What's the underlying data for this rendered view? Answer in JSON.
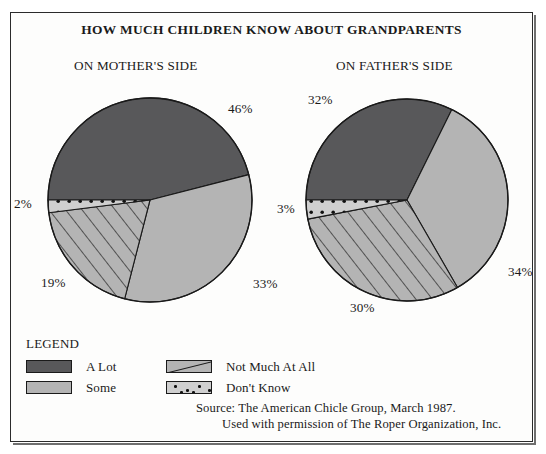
{
  "figure": {
    "title": "HOW MUCH CHILDREN KNOW ABOUT GRANDPARENTS",
    "subtitle_left": "ON MOTHER'S SIDE",
    "subtitle_right": "ON FATHER'S SIDE"
  },
  "legend": {
    "heading": "LEGEND",
    "items": [
      {
        "label": "A Lot",
        "pattern": "solid-dark",
        "color": "#58585a"
      },
      {
        "label": "Not Much At All",
        "pattern": "diagonal",
        "color": "#b4b4b4"
      },
      {
        "label": "Some",
        "pattern": "solid-light",
        "color": "#b4b4b4"
      },
      {
        "label": "Don't Know",
        "pattern": "dots",
        "color": "#cfcfcf"
      }
    ]
  },
  "source": {
    "line1": "Source: The American Chicle Group, March 1987.",
    "line2": "Used with permission of The Roper Organization, Inc."
  },
  "labels": {
    "mother": {
      "a_lot": "46%",
      "some": "33%",
      "not_much": "19%",
      "dont_know": "2%"
    },
    "father": {
      "a_lot": "32%",
      "some": "34%",
      "not_much": "30%",
      "dont_know": "3%"
    }
  },
  "chart_data": {
    "type": "pie",
    "title": "HOW MUCH CHILDREN KNOW ABOUT GRANDPARENTS",
    "xlabel": "",
    "ylabel": "",
    "grid": false,
    "legend_position": "bottom-left",
    "units": "percent",
    "categories": [
      "A Lot",
      "Some",
      "Not Much At All",
      "Don't Know"
    ],
    "colors": {
      "A Lot": "#58585a",
      "Some": "#b4b4b4",
      "Not Much At All": "#b4b4b4",
      "Don't Know": "#cfcfcf"
    },
    "charts": [
      {
        "name": "ON MOTHER'S SIDE",
        "labels": [
          "A Lot",
          "Some",
          "Not Much At All",
          "Don't Know"
        ],
        "values": [
          46,
          33,
          19,
          2
        ],
        "data_labels": [
          "46%",
          "33%",
          "19%",
          "2%"
        ]
      },
      {
        "name": "ON FATHER'S SIDE",
        "labels": [
          "A Lot",
          "Some",
          "Not Much At All",
          "Don't Know"
        ],
        "values": [
          32,
          34,
          30,
          3
        ],
        "data_labels": [
          "32%",
          "34%",
          "30%",
          "3%"
        ]
      }
    ],
    "annotations": [
      "Source: The American Chicle Group, March 1987.",
      "Used with permission of The Roper Organization, Inc."
    ]
  },
  "geometry": {
    "mother": {
      "cx": 150,
      "cy": 200,
      "r": 102,
      "start_angle_deg": 180
    },
    "father": {
      "cx": 407,
      "cy": 200,
      "r": 101,
      "start_angle_deg": 180
    }
  }
}
